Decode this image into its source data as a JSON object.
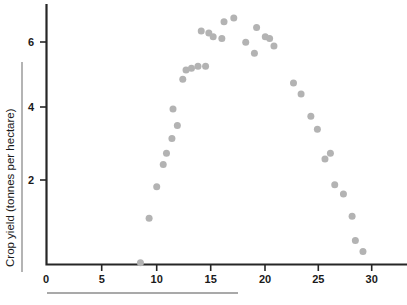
{
  "chart_data": {
    "type": "scatter",
    "title": "",
    "xlabel": "",
    "ylabel": "Crop yield (tonnes per hectare)",
    "xlim": [
      0,
      33
    ],
    "ylim": [
      0,
      7.1
    ],
    "xticks": [
      0,
      5,
      10,
      15,
      20,
      25,
      30
    ],
    "xtick_labels": [
      "0",
      "5",
      "10",
      "15",
      "20",
      "25",
      "30"
    ],
    "yticks": [
      2,
      4,
      6
    ],
    "ytick_labels": [
      "2",
      "4",
      "6"
    ],
    "grid": false,
    "legend": false,
    "marker": {
      "shape": "circle",
      "color": "#b3b3b3",
      "size": 7
    },
    "series": [
      {
        "name": "Crop yield",
        "points": [
          [
            8.7,
            0.05
          ],
          [
            9.5,
            1.25
          ],
          [
            10.2,
            2.1
          ],
          [
            10.8,
            2.7
          ],
          [
            11.1,
            3.0
          ],
          [
            11.6,
            3.4
          ],
          [
            11.7,
            4.2
          ],
          [
            12.1,
            3.75
          ],
          [
            12.6,
            5.0
          ],
          [
            12.9,
            5.25
          ],
          [
            13.4,
            5.3
          ],
          [
            14.0,
            5.35
          ],
          [
            14.3,
            6.3
          ],
          [
            14.7,
            5.35
          ],
          [
            15.0,
            6.25
          ],
          [
            15.4,
            6.15
          ],
          [
            16.2,
            6.1
          ],
          [
            16.4,
            6.55
          ],
          [
            17.3,
            6.65
          ],
          [
            18.4,
            6.0
          ],
          [
            19.2,
            5.7
          ],
          [
            19.4,
            6.4
          ],
          [
            20.2,
            6.15
          ],
          [
            20.6,
            6.1
          ],
          [
            21.0,
            5.9
          ],
          [
            22.8,
            4.9
          ],
          [
            23.5,
            4.6
          ],
          [
            24.4,
            4.0
          ],
          [
            25.0,
            3.65
          ],
          [
            25.7,
            2.85
          ],
          [
            26.2,
            3.0
          ],
          [
            26.6,
            2.15
          ],
          [
            27.4,
            1.9
          ],
          [
            28.2,
            1.3
          ],
          [
            28.5,
            0.65
          ],
          [
            29.2,
            0.35
          ]
        ]
      }
    ]
  },
  "axes": {
    "y_title": "Crop yield (tonnes per hectare)",
    "x_tick_labels": [
      "0",
      "5",
      "10",
      "15",
      "20",
      "25",
      "30"
    ],
    "y_tick_labels": [
      "6",
      "4",
      "2"
    ],
    "origin_label": "0"
  },
  "colors": {
    "marker": "#b3b3b3",
    "axis": "#262626",
    "rule": "#8c8c8c",
    "text": "#1a1a1a",
    "background": "#ffffff"
  }
}
